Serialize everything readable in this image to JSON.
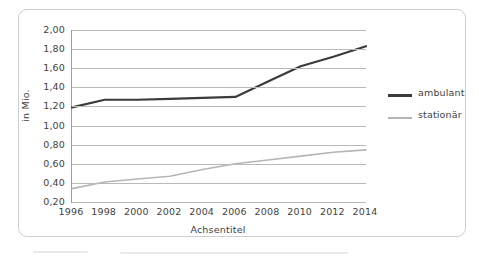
{
  "chart_data": {
    "type": "line",
    "title": "",
    "xlabel": "Achsentitel",
    "ylabel": "in Mio.",
    "x": [
      1996,
      1998,
      2000,
      2002,
      2004,
      2006,
      2008,
      2010,
      2012,
      2014
    ],
    "categories": [
      "1996",
      "1998",
      "2000",
      "2002",
      "2004",
      "2006",
      "2008",
      "2010",
      "2012",
      "2014"
    ],
    "series": [
      {
        "name": "ambulant",
        "color": "#3b3b3b",
        "width": 2.2,
        "values": [
          1.19,
          1.27,
          1.27,
          1.28,
          1.29,
          1.3,
          1.46,
          1.62,
          1.72,
          1.83
        ]
      },
      {
        "name": "stationär",
        "color": "#b5b5b5",
        "width": 1.6,
        "values": [
          0.34,
          0.41,
          0.44,
          0.47,
          0.54,
          0.6,
          0.64,
          0.68,
          0.72,
          0.745
        ]
      }
    ],
    "ylim": [
      0.2,
      2.0
    ],
    "yticks": [
      2.0,
      1.8,
      1.6,
      1.4,
      1.2,
      1.0,
      0.8,
      0.6,
      0.4,
      0.2
    ],
    "ytick_labels": [
      "2,00",
      "1,80",
      "1,60",
      "1,40",
      "1,20",
      "1,00",
      "0,80",
      "0,60",
      "0,40",
      "0,20"
    ],
    "xlim": [
      1996,
      2014
    ],
    "grid": "horizontal",
    "legend_position": "right",
    "legend": [
      "ambulant",
      "stationär"
    ]
  },
  "colors": {
    "ambulant": "#3b3b3b",
    "stationaer": "#b5b5b5",
    "gridline": "#b9b9b9",
    "axis": "#9d9d9d",
    "frame": "#cfcfcf",
    "text": "#3f3f3f",
    "background": "#ffffff"
  }
}
